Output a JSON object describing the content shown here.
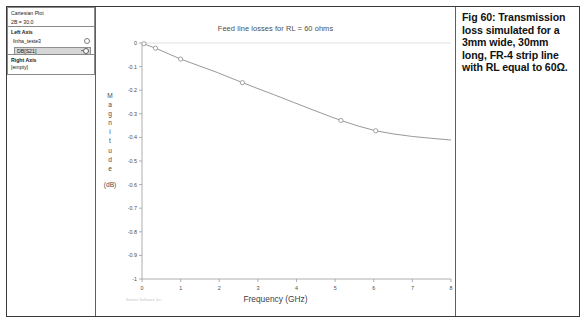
{
  "panel": {
    "title": "Cartesian Plot",
    "subtitle": "2B = 30.0",
    "left_axis_label": "Left Axis",
    "project_name": "linha_teste3",
    "trace_name": "DB[S21]",
    "right_axis_label": "Right Axis",
    "right_axis_value": "[empty]"
  },
  "chart_title": "Feed line losses for RL = 60 ohms",
  "y_axis_title_letters": [
    "M",
    "a",
    "g",
    "n",
    "i",
    "t",
    "u",
    "d",
    "e"
  ],
  "y_axis_title_unit": "(dB)",
  "x_axis_title": "Frequency (GHz)",
  "watermark": "Sonnet Software Inc.",
  "caption": "Fig 60: Transmission loss simulated for a 3mm wide, 30mm long, FR-4 strip line with RL equal to 60Ω.",
  "colors": {
    "curve": "#8c8c8c",
    "axis": "#9a9a9a",
    "text": "#4b4b4b",
    "panel_border": "#8a8a8a",
    "frame": "#3a3a3a",
    "selected_row": "#d6d6d6"
  },
  "chart_data": {
    "type": "line",
    "title": "Feed line losses for RL = 60 ohms",
    "xlabel": "Frequency (GHz)",
    "ylabel": "Magnitude (dB)",
    "xlim": [
      0,
      8
    ],
    "ylim": [
      -1,
      0
    ],
    "xticks": [
      0,
      1,
      2,
      3,
      4,
      5,
      6,
      7,
      8
    ],
    "xtick_labels": [
      "0",
      "1",
      "2",
      "3",
      "4",
      "5",
      "6",
      "7",
      "8"
    ],
    "yticks": [
      0,
      -0.1,
      -0.2,
      -0.3,
      -0.4,
      -0.5,
      -0.6,
      -0.7,
      -0.8,
      -0.9,
      -1
    ],
    "ytick_labels": [
      "0",
      "-0.1",
      "-0.2",
      "-0.3",
      "-0.4",
      "-0.5",
      "-0.6",
      "-0.7",
      "-0.8",
      "-0.9",
      "-1"
    ],
    "grid": false,
    "legend": "none",
    "series": [
      {
        "name": "DB[S21]",
        "marker": "circle-open",
        "x": [
          0.05,
          0.12,
          0.35,
          0.62,
          1.0,
          1.45,
          1.95,
          2.45,
          2.9,
          3.4,
          3.9,
          4.4,
          4.9,
          5.15,
          5.6,
          6.05,
          6.5,
          7.0,
          7.5,
          8.0
        ],
        "y": [
          -0.003,
          -0.008,
          -0.022,
          -0.041,
          -0.068,
          -0.095,
          -0.125,
          -0.158,
          -0.187,
          -0.218,
          -0.25,
          -0.282,
          -0.313,
          -0.328,
          -0.352,
          -0.372,
          -0.385,
          -0.396,
          -0.404,
          -0.411
        ],
        "marker_points": [
          {
            "x": 0.05,
            "y": -0.003
          },
          {
            "x": 0.35,
            "y": -0.022
          },
          {
            "x": 1.0,
            "y": -0.068
          },
          {
            "x": 2.6,
            "y": -0.168
          },
          {
            "x": 5.15,
            "y": -0.328
          },
          {
            "x": 6.05,
            "y": -0.372
          }
        ]
      }
    ]
  }
}
